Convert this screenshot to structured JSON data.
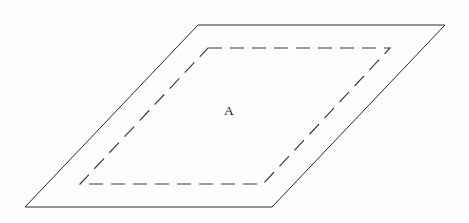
{
  "figure": {
    "canvas": {
      "width": 469,
      "height": 223,
      "background": "#fdfdfd"
    },
    "shapes": {
      "outer_plane": {
        "name": "solid-parallelogram",
        "style": "solid",
        "stroke_color": "#2b2b2b",
        "stroke_width": 1,
        "points": "198,25 445,25 272,207 25,207",
        "vertices": [
          {
            "label": "top-left",
            "x": 198,
            "y": 25
          },
          {
            "label": "top-right",
            "x": 445,
            "y": 25
          },
          {
            "label": "bottom-right",
            "x": 272,
            "y": 207
          },
          {
            "label": "bottom-left",
            "x": 25,
            "y": 207
          }
        ]
      },
      "inner_region": {
        "name": "dashed-parallelogram",
        "style": "dashed",
        "stroke_color": "#3a3a3a",
        "stroke_width": 1.15,
        "dash_pattern": "14 8",
        "points": "208,48 390,48 263,184 80,184",
        "vertices": [
          {
            "label": "top-left",
            "x": 208,
            "y": 48
          },
          {
            "label": "top-right",
            "x": 390,
            "y": 48
          },
          {
            "label": "bottom-right",
            "x": 263,
            "y": 184
          },
          {
            "label": "bottom-left",
            "x": 80,
            "y": 184
          }
        ]
      }
    },
    "labels": {
      "region_a": {
        "text": "A",
        "x": 229,
        "y": 115,
        "font_size": 13.5,
        "color": "#1a1a1a"
      }
    }
  }
}
